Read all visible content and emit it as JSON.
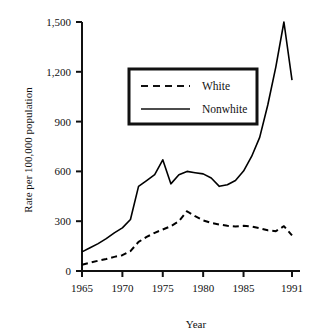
{
  "chart_data": {
    "type": "line",
    "title": "",
    "xlabel": "Year",
    "ylabel": "Rate per 100,000 population",
    "xlim": [
      1965,
      1991
    ],
    "ylim": [
      0,
      1500
    ],
    "grid": false,
    "legend_position": "top-center",
    "xticks": [
      "1965",
      "1970",
      "1975",
      "1980",
      "1985",
      "1991"
    ],
    "xtick_values": [
      1965,
      1970,
      1975,
      1980,
      1985,
      1991
    ],
    "yticks": [
      "0",
      "300",
      "600",
      "900",
      "1,200",
      "1,500"
    ],
    "ytick_values": [
      0,
      300,
      600,
      900,
      1200,
      1500
    ],
    "x": [
      1965,
      1966,
      1967,
      1968,
      1969,
      1970,
      1971,
      1972,
      1973,
      1974,
      1975,
      1976,
      1977,
      1978,
      1979,
      1980,
      1981,
      1982,
      1983,
      1984,
      1985,
      1986,
      1987,
      1988,
      1989,
      1990,
      1991
    ],
    "series": [
      {
        "name": "White",
        "style": "dashed",
        "color": "#000000",
        "values": [
          38,
          50,
          62,
          72,
          85,
          95,
          120,
          175,
          205,
          230,
          250,
          270,
          300,
          360,
          330,
          305,
          290,
          280,
          272,
          268,
          272,
          268,
          258,
          245,
          240,
          270,
          215
        ]
      },
      {
        "name": "Nonwhite",
        "style": "solid",
        "color": "#000000",
        "values": [
          115,
          140,
          165,
          195,
          230,
          260,
          310,
          510,
          545,
          580,
          670,
          525,
          580,
          600,
          592,
          585,
          560,
          510,
          520,
          545,
          602,
          690,
          805,
          1000,
          1230,
          1500,
          1150
        ]
      }
    ]
  },
  "legend": {
    "entries": [
      {
        "label": "White",
        "style": "dashed"
      },
      {
        "label": "Nonwhite",
        "style": "solid"
      }
    ]
  },
  "axes": {
    "x_title": "Year",
    "y_title": "Rate per 100,000 population"
  }
}
